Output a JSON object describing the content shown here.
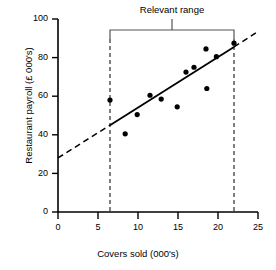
{
  "chart_data": {
    "type": "scatter",
    "title": "",
    "xlabel": "Covers sold (000's)",
    "ylabel": "Restaurant payroll (£ 000's)",
    "xlim": [
      0,
      25
    ],
    "ylim": [
      0,
      100
    ],
    "xticks": [
      0,
      5,
      10,
      15,
      20,
      25
    ],
    "yticks": [
      0,
      20,
      40,
      60,
      80,
      100
    ],
    "xtick_labels": [
      "0",
      "5",
      "10",
      "15",
      "20",
      "25"
    ],
    "ytick_labels": [
      "0",
      "20",
      "40",
      "60",
      "80",
      "100"
    ],
    "grid": false,
    "legend": "none",
    "points": [
      {
        "x": 6.5,
        "y": 58.0
      },
      {
        "x": 8.4,
        "y": 40.5
      },
      {
        "x": 9.9,
        "y": 50.5
      },
      {
        "x": 11.5,
        "y": 60.5
      },
      {
        "x": 12.9,
        "y": 58.5
      },
      {
        "x": 14.9,
        "y": 54.5
      },
      {
        "x": 16.0,
        "y": 72.5
      },
      {
        "x": 17.0,
        "y": 75.0
      },
      {
        "x": 18.5,
        "y": 84.5
      },
      {
        "x": 18.6,
        "y": 64.0
      },
      {
        "x": 19.8,
        "y": 80.5
      },
      {
        "x": 22.0,
        "y": 87.5
      }
    ],
    "trend_line": {
      "solid_segment": {
        "x0": 6.5,
        "y0": 45.0,
        "x1": 22.0,
        "y1": 85.5
      },
      "dashed_extension_low": {
        "x0": 0.0,
        "y0": 28.0,
        "x1": 6.5,
        "y1": 45.0
      },
      "dashed_extension_high": {
        "x0": 22.0,
        "y0": 85.5,
        "x1": 25.0,
        "y1": 93.5
      }
    },
    "annotations": [
      {
        "name": "relevant-range",
        "label": "Relevant range",
        "x_start": 6.5,
        "x_end": 22.0
      }
    ],
    "relevant_range": {
      "label": "Relevant range",
      "x_start": 6.5,
      "x_end": 22.0
    }
  },
  "axes": {
    "y_title": "Restaurant payroll (£ 000's)",
    "x_title": "Covers sold (000's)",
    "y_labels": [
      "100",
      "80",
      "60",
      "40",
      "20",
      "0"
    ],
    "x_labels": [
      "0",
      "5",
      "10",
      "15",
      "20",
      "25"
    ]
  },
  "colors": {
    "ink": "#000000",
    "background": "#ffffff",
    "bracket": "#555555"
  }
}
